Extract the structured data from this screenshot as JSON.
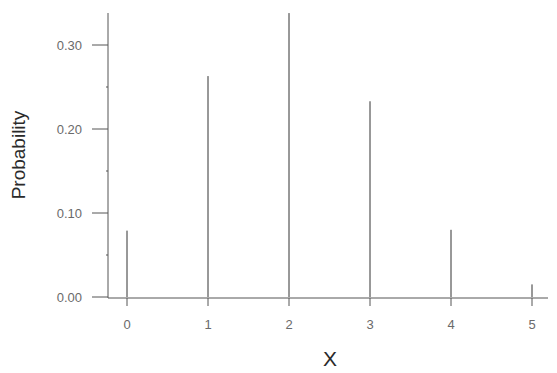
{
  "chart_data": {
    "type": "bar",
    "style": "spike/stem lines (probability mass function)",
    "title": "",
    "xlabel": "X",
    "ylabel": "Probability",
    "categories": [
      "0",
      "1",
      "2",
      "3",
      "4",
      "5"
    ],
    "x": [
      0,
      1,
      2,
      3,
      4,
      5
    ],
    "values": [
      0.079,
      0.263,
      0.338,
      0.233,
      0.08,
      0.015
    ],
    "xlim": [
      -0.35,
      5.1
    ],
    "ylim": [
      0.0,
      0.34
    ],
    "yticks": [
      0.0,
      0.1,
      0.2,
      0.3
    ],
    "ytick_labels": [
      "0.00",
      "0.10",
      "0.20",
      "0.30"
    ],
    "yminor_ticks": [
      0.05,
      0.15,
      0.25
    ],
    "xticks": [
      0,
      1,
      2,
      3,
      4,
      5
    ],
    "xtick_labels": [
      "0",
      "1",
      "2",
      "3",
      "4",
      "5"
    ],
    "grid": false,
    "legend": null,
    "colors": {
      "axis": "#555555",
      "bars": "#333333",
      "tick_labels": "#6a6a6a",
      "axis_titles": "#2a2a2a"
    }
  }
}
